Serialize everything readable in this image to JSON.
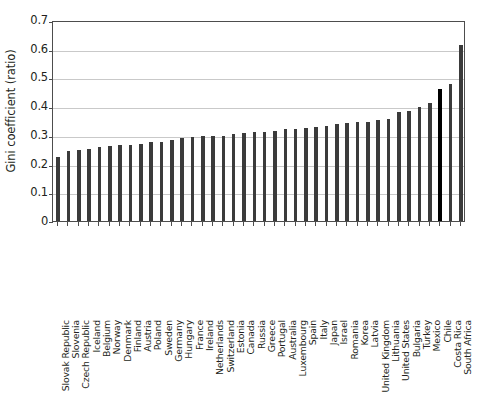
{
  "chart_data": {
    "type": "bar",
    "title": "",
    "subtitle": "",
    "xlabel": "",
    "ylabel": "Gini coefficient (ratio)",
    "ylim": [
      0,
      0.7
    ],
    "ytick_values": [
      0,
      0.1,
      0.2,
      0.3,
      0.4,
      0.5,
      0.6,
      0.7
    ],
    "ytick_labels": [
      "0",
      "0.1",
      "0.2",
      "0.3",
      "0.4",
      "0.5",
      "0.6",
      "0.7"
    ],
    "grid": "horizontal",
    "legend": "none",
    "bar_color": "#3b3b3b",
    "highlight_color": "#000000",
    "highlight_category": "Chile",
    "categories": [
      "Slovak Republic",
      "Slovenia",
      "Czech Republic",
      "Iceland",
      "Belgium",
      "Norway",
      "Denmark",
      "Finland",
      "Austria",
      "Poland",
      "Sweden",
      "Germany",
      "Hungary",
      "France",
      "Ireland",
      "Netherlands",
      "Switzerland",
      "Estonia",
      "Canada",
      "Russia",
      "Greece",
      "Portugal",
      "Australia",
      "Luxembourg",
      "Spain",
      "Italy",
      "Japan",
      "Israel",
      "Romania",
      "Korea",
      "Latvia",
      "United Kingdom",
      "Lithuania",
      "United States",
      "Bulgaria",
      "Turkey",
      "Mexico",
      "Chile",
      "Costa Rica",
      "South Africa"
    ],
    "values": [
      0.222,
      0.244,
      0.249,
      0.251,
      0.259,
      0.262,
      0.263,
      0.266,
      0.268,
      0.275,
      0.275,
      0.281,
      0.289,
      0.291,
      0.295,
      0.295,
      0.296,
      0.304,
      0.307,
      0.31,
      0.311,
      0.313,
      0.32,
      0.322,
      0.325,
      0.328,
      0.33,
      0.339,
      0.34,
      0.345,
      0.346,
      0.351,
      0.355,
      0.378,
      0.383,
      0.398,
      0.412,
      0.46,
      0.478,
      0.612
    ]
  }
}
